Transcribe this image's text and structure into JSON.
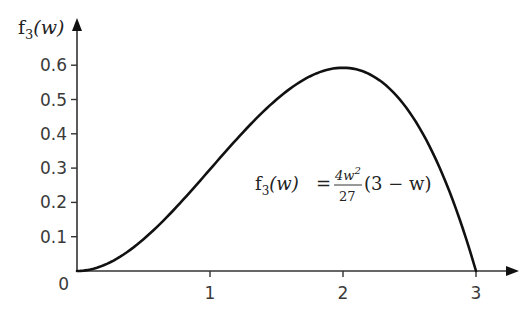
{
  "chart_data": {
    "type": "line",
    "title": "",
    "xlabel": "",
    "ylabel": "f3(w)",
    "ylabel_parts": {
      "base": "f",
      "sub": "3",
      "arg": "(w)"
    },
    "xlim": [
      0,
      3.3
    ],
    "ylim": [
      0,
      0.65
    ],
    "x_ticks": [
      1,
      2,
      3
    ],
    "x_tick_labels": [
      "1",
      "2",
      "3"
    ],
    "y_ticks": [
      0.1,
      0.2,
      0.3,
      0.4,
      0.5,
      0.6
    ],
    "y_tick_labels": [
      "0.1",
      "0.2",
      "0.3",
      "0.4",
      "0.5",
      "0.6"
    ],
    "origin_label": "0",
    "grid": false,
    "legend": null,
    "annotation": {
      "text": "f3(w) = 4w^2/27 (3 - w)",
      "lhs_base": "f",
      "lhs_sub": "3",
      "lhs_arg": "(w)",
      "equals": "=",
      "numerator": "4w",
      "numerator_sup": "2",
      "denominator": "27",
      "factor": "(3 − w)",
      "position": {
        "w": 1.35,
        "f": 0.24
      }
    },
    "series": [
      {
        "name": "f3(w)",
        "color": "#111111",
        "x": [
          0,
          0.25,
          0.5,
          0.75,
          1.0,
          1.25,
          1.5,
          1.75,
          2.0,
          2.25,
          2.5,
          2.75,
          3.0
        ],
        "values": [
          0,
          0.0255,
          0.0926,
          0.1875,
          0.2963,
          0.4051,
          0.5,
          0.5671,
          0.5926,
          0.5625,
          0.463,
          0.2801,
          0
        ]
      }
    ]
  }
}
